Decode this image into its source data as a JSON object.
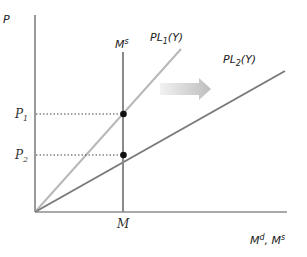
{
  "diagram": {
    "type": "money-market-shift",
    "axes": {
      "y_label": "P",
      "x_label_main": "M",
      "x_label_sup1": "d",
      "x_label_sep": ", M",
      "x_label_sup2": "s"
    },
    "money_supply": {
      "label_main": "M",
      "label_sup": "s",
      "x_tick_label": "M"
    },
    "curves": [
      {
        "id": "PL1",
        "label_pre": "PL",
        "label_sub": "1",
        "label_post": "(Y)",
        "color": "#b8b8b8"
      },
      {
        "id": "PL2",
        "label_pre": "PL",
        "label_sub": "2",
        "label_post": "(Y)",
        "color": "#7a7a7a"
      }
    ],
    "price_levels": [
      {
        "label_main": "P",
        "label_sub": "1"
      },
      {
        "label_main": "P",
        "label_sub": "2"
      }
    ],
    "shift_arrow": {
      "direction": "right",
      "color": "#c8c8c8"
    },
    "colors": {
      "axis": "#555555",
      "money_supply": "#8a8a8a",
      "point": "#111111",
      "guide": "#444444"
    }
  }
}
